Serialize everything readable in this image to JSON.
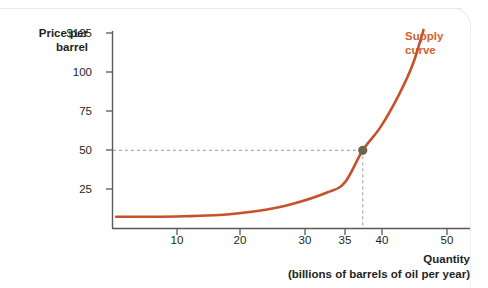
{
  "chart_data": {
    "type": "line",
    "title": "",
    "xlabel": "Quantity",
    "xlabel_sub": "(billions of barrels of oil per year)",
    "ylabel": "Price per barrel",
    "ylabel_line1": "Price per",
    "ylabel_line2": "barrel",
    "xlim": [
      0,
      50
    ],
    "ylim": [
      0,
      125
    ],
    "grid": false,
    "legend_position": "inline-right",
    "xticks": [
      10,
      20,
      30,
      35,
      40,
      50
    ],
    "xtick_labels": [
      "10",
      "20",
      "30",
      "35",
      "40",
      "50"
    ],
    "yticks": [
      25,
      50,
      75,
      100,
      125
    ],
    "ytick_labels": [
      "25",
      "50",
      "75",
      "100",
      "$125"
    ],
    "series": [
      {
        "name": "Supply curve",
        "color": "#c8502a",
        "points": [
          {
            "x": 0.5,
            "y": 7.5
          },
          {
            "x": 5,
            "y": 7.5
          },
          {
            "x": 10,
            "y": 7.8
          },
          {
            "x": 15,
            "y": 8.6
          },
          {
            "x": 20,
            "y": 11.0
          },
          {
            "x": 25,
            "y": 15.5
          },
          {
            "x": 30,
            "y": 23.0
          },
          {
            "x": 32.5,
            "y": 29.5
          },
          {
            "x": 35,
            "y": 50.0
          },
          {
            "x": 37.5,
            "y": 65.0
          },
          {
            "x": 40,
            "y": 85.0
          },
          {
            "x": 42,
            "y": 105.0
          },
          {
            "x": 43.5,
            "y": 127.0
          }
        ]
      }
    ],
    "annotations": [
      {
        "name": "equilibrium-point",
        "x": 35,
        "y": 50,
        "color": "#6b6550",
        "guides": "dashed",
        "guide_color": "#9a9a9a"
      }
    ],
    "series_label": {
      "line1": "Supply",
      "line2": "curve",
      "color": "#d2622f"
    }
  }
}
